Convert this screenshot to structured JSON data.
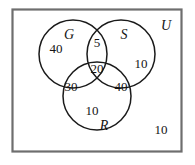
{
  "diagram": {
    "universe_label": "U",
    "stroke_color": "#1a1a1a",
    "frame_color": "#6e6e6e",
    "background_color": "#ffffff",
    "sets": [
      {
        "key": "G",
        "label": "G"
      },
      {
        "key": "S",
        "label": "S"
      },
      {
        "key": "R",
        "label": "R"
      }
    ],
    "regions": [
      {
        "key": "G_only",
        "label": "G only",
        "value": "40"
      },
      {
        "key": "S_only",
        "label": "S only",
        "value": "10"
      },
      {
        "key": "R_only",
        "label": "R only",
        "value": "10"
      },
      {
        "key": "G_and_S",
        "label": "G and S only",
        "value": "5"
      },
      {
        "key": "G_and_R",
        "label": "G and R only",
        "value": "30"
      },
      {
        "key": "S_and_R",
        "label": "S and R only",
        "value": "40"
      },
      {
        "key": "G_S_R",
        "label": "G and S and R",
        "value": "20"
      },
      {
        "key": "outside",
        "label": "outside all sets",
        "value": "10"
      }
    ]
  }
}
